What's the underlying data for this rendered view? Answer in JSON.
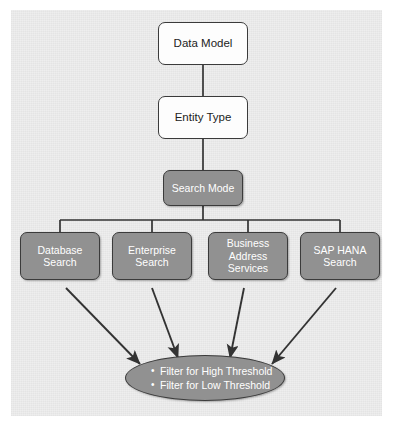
{
  "diagram": {
    "nodes": {
      "data_model": "Data Model",
      "entity_type": "Entity Type",
      "search_mode": "Search Mode",
      "database_search": "Database\nSearch",
      "enterprise_search": "Enterprise\nSearch",
      "business_address_services": "Business\nAddress\nServices",
      "sap_hana_search": "SAP HANA\nSearch"
    },
    "filters": {
      "items": [
        "Filter for High Threshold",
        "Filter for Low Threshold"
      ]
    },
    "colors": {
      "canvas": "#eeeeee",
      "node_fill_gray": "#919191",
      "node_fill_white": "#fdfdfd",
      "border": "#3b3b3b",
      "text_on_gray": "#ffffff",
      "text_on_white": "#222222",
      "connector": "#333333"
    }
  }
}
